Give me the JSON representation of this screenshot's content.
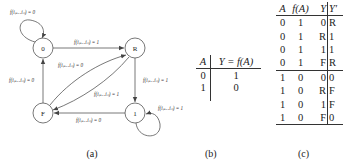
{
  "figure_a": {
    "caption": "(a)",
    "nodes": {
      "zero": "0",
      "rise": "R",
      "fall": "F",
      "one": "1"
    },
    "edges": {
      "self_zero": "f(iₚ…iₙ) = 0",
      "zero_to_rise": "f(iₚ…iₙ) = 1",
      "fall_to_rise": "f(iₚ…iₙ) = 0",
      "fall_to_zero": "f(iₚ…iₙ) = 0",
      "rise_to_one": "f(iₚ…iₙ) = 1",
      "rise_to_fall": "f(iₚ…iₙ) = 1",
      "one_to_fall": "f(iₚ…iₙ) = 0",
      "self_one": "f(iₚ…iₙ) = 1"
    }
  },
  "figure_b": {
    "caption": "(b)",
    "headers": [
      "A",
      "Y = f(A)"
    ],
    "rows": [
      [
        "0",
        "1"
      ],
      [
        "1",
        "0"
      ]
    ]
  },
  "figure_c": {
    "caption": "(c)",
    "headers": [
      "A",
      "f(A)",
      "Y",
      "Y′"
    ],
    "rows": [
      [
        "0",
        "1",
        "0",
        "R"
      ],
      [
        "0",
        "1",
        "R",
        "1"
      ],
      [
        "0",
        "1",
        "1",
        "1"
      ],
      [
        "0",
        "1",
        "F",
        "R"
      ],
      [
        "1",
        "0",
        "0",
        "0"
      ],
      [
        "1",
        "0",
        "R",
        "F"
      ],
      [
        "1",
        "0",
        "1",
        "F"
      ],
      [
        "1",
        "0",
        "F",
        "0"
      ]
    ]
  }
}
